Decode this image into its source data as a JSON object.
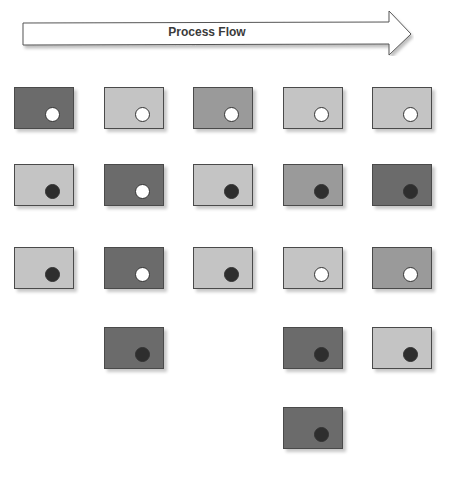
{
  "header": {
    "title": "Process Flow"
  },
  "colors": {
    "dark": "#6b6b6b",
    "mid": "#9a9a9a",
    "light": "#c4c4c4",
    "dot_white": "#ffffff",
    "dot_black": "#2e2e2e"
  },
  "columns_x": [
    14,
    104,
    193,
    283,
    372
  ],
  "rows_y": [
    87,
    164,
    247,
    327,
    407
  ],
  "boxes": [
    {
      "col": 0,
      "row": 0,
      "shade": "dark",
      "dot": "white"
    },
    {
      "col": 1,
      "row": 0,
      "shade": "light",
      "dot": "white"
    },
    {
      "col": 2,
      "row": 0,
      "shade": "mid",
      "dot": "white"
    },
    {
      "col": 3,
      "row": 0,
      "shade": "light",
      "dot": "white"
    },
    {
      "col": 4,
      "row": 0,
      "shade": "light",
      "dot": "white"
    },
    {
      "col": 0,
      "row": 1,
      "shade": "light",
      "dot": "black"
    },
    {
      "col": 1,
      "row": 1,
      "shade": "dark",
      "dot": "white"
    },
    {
      "col": 2,
      "row": 1,
      "shade": "light",
      "dot": "black"
    },
    {
      "col": 3,
      "row": 1,
      "shade": "mid",
      "dot": "black"
    },
    {
      "col": 4,
      "row": 1,
      "shade": "dark",
      "dot": "black"
    },
    {
      "col": 0,
      "row": 2,
      "shade": "light",
      "dot": "black"
    },
    {
      "col": 1,
      "row": 2,
      "shade": "dark",
      "dot": "white"
    },
    {
      "col": 2,
      "row": 2,
      "shade": "light",
      "dot": "black"
    },
    {
      "col": 3,
      "row": 2,
      "shade": "light",
      "dot": "white"
    },
    {
      "col": 4,
      "row": 2,
      "shade": "mid",
      "dot": "white"
    },
    {
      "col": 1,
      "row": 3,
      "shade": "dark",
      "dot": "black"
    },
    {
      "col": 3,
      "row": 3,
      "shade": "dark",
      "dot": "black"
    },
    {
      "col": 4,
      "row": 3,
      "shade": "light",
      "dot": "black"
    },
    {
      "col": 3,
      "row": 4,
      "shade": "dark",
      "dot": "black"
    }
  ]
}
